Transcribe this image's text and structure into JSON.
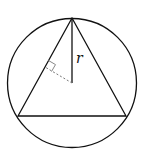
{
  "diagram": {
    "labels": {
      "radius": "r"
    },
    "colors": {
      "stroke": "#111111",
      "dashed": "#777777",
      "marker": "#888888",
      "background": "#ffffff"
    },
    "circle": {
      "cx": 72,
      "cy": 83,
      "r": 64.5
    },
    "triangle": {
      "vertices": [
        {
          "name": "top",
          "x": 72,
          "y": 18
        },
        {
          "name": "bottom-left",
          "x": 18,
          "y": 116
        },
        {
          "name": "bottom-right",
          "x": 126,
          "y": 116
        }
      ]
    },
    "radius_segment": {
      "x1": 72,
      "y1": 18,
      "x2": 72,
      "y2": 83
    },
    "apothem_segment": {
      "x1": 72,
      "y1": 83,
      "x2": 45,
      "y2": 67
    }
  }
}
